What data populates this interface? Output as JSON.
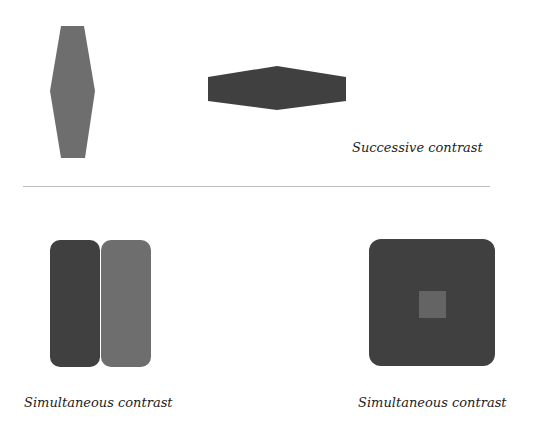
{
  "colors": {
    "light_gray": "#6e6e6e",
    "dark_gray": "#404040",
    "inner_gray": "#646464",
    "divider": "#bdbdbd",
    "background": "#ffffff"
  },
  "top_section": {
    "shapes": [
      {
        "name": "vertical-hexagon",
        "color": "light_gray"
      },
      {
        "name": "horizontal-hexagon",
        "color": "dark_gray"
      }
    ],
    "caption": "Successive contrast"
  },
  "bottom_left": {
    "shapes": [
      {
        "name": "dark-rounded-rect",
        "color": "dark_gray"
      },
      {
        "name": "light-rounded-rect",
        "color": "light_gray"
      }
    ],
    "caption": "Simultaneous contrast"
  },
  "bottom_right": {
    "shapes": [
      {
        "name": "dark-rounded-square",
        "color": "dark_gray"
      },
      {
        "name": "inner-square",
        "color": "inner_gray"
      }
    ],
    "caption": "Simultaneous contrast"
  }
}
